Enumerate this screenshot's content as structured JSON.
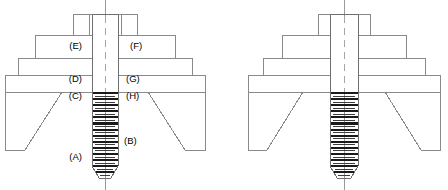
{
  "figure": {
    "background_color": "#ffffff",
    "line_color": "#8a8a8a",
    "thread_color": "#1a1a1a",
    "text_color": "#000000",
    "width": 448,
    "height": 190
  },
  "callouts": [
    {
      "id": "A",
      "label": "(A)",
      "x": 82,
      "y": 157,
      "anchor": "end",
      "description": "bolt thread lower region"
    },
    {
      "id": "B",
      "label": "(B)",
      "x": 124,
      "y": 141,
      "anchor": "start",
      "description": "bolt thread shank"
    },
    {
      "id": "C",
      "label": "(C)",
      "x": 82,
      "y": 96,
      "anchor": "end",
      "description": "left clamped member lower face"
    },
    {
      "id": "D",
      "label": "(D)",
      "x": 82,
      "y": 79,
      "anchor": "end",
      "description": "left base block"
    },
    {
      "id": "E",
      "label": "(E)",
      "x": 82,
      "y": 46,
      "anchor": "end",
      "description": "left upper washer step"
    },
    {
      "id": "F",
      "label": "(F)",
      "x": 130,
      "y": 46,
      "anchor": "start",
      "description": "right upper washer step"
    },
    {
      "id": "G",
      "label": "(G)",
      "x": 126,
      "y": 79,
      "anchor": "start",
      "description": "right base block"
    },
    {
      "id": "H",
      "label": "(H)",
      "x": 126,
      "y": 96,
      "anchor": "start",
      "description": "right clamped member lower face"
    }
  ],
  "diagrams": [
    {
      "name": "left-assembly",
      "cx": 105,
      "has_callouts": true,
      "nut": {
        "x": 73,
        "y": 14,
        "w": 64,
        "h": 21,
        "dividers": [
          89,
          121
        ]
      },
      "steps": [
        {
          "x": 35,
          "y": 35,
          "w": 140,
          "h": 23
        },
        {
          "x": 18,
          "y": 58,
          "w": 174,
          "h": 17
        },
        {
          "x": 5,
          "y": 75,
          "w": 200,
          "h": 17
        }
      ],
      "base": {
        "x": 5,
        "y": 92,
        "w": 200,
        "h": 58,
        "taper_top_left": 62,
        "taper_bot_left": 25,
        "taper_top_right": 148,
        "taper_bot_right": 185
      },
      "shank": {
        "x1": 92,
        "x2": 118,
        "top": 14,
        "bottom": 178,
        "thread_top": 93,
        "tip_start": 166,
        "tip_radius": 7,
        "thread_pitch": 6.1,
        "thread_inset": 3
      }
    },
    {
      "name": "right-assembly",
      "cx": 344,
      "has_callouts": false,
      "nut": {
        "x": 318,
        "y": 14,
        "w": 52,
        "h": 21,
        "dividers": [
          331,
          357
        ]
      },
      "steps": [
        {
          "x": 282,
          "y": 35,
          "w": 124,
          "h": 23
        },
        {
          "x": 263,
          "y": 58,
          "w": 162,
          "h": 17
        },
        {
          "x": 248,
          "y": 75,
          "w": 192,
          "h": 17
        }
      ],
      "base": {
        "x": 248,
        "y": 92,
        "w": 192,
        "h": 58,
        "taper_top_left": 303,
        "taper_bot_left": 267,
        "taper_top_right": 385,
        "taper_bot_right": 421
      },
      "shank": {
        "x1": 330,
        "x2": 358,
        "top": 14,
        "bottom": 178,
        "thread_top": 93,
        "tip_start": 166,
        "tip_radius": 7,
        "thread_pitch": 6.1,
        "thread_inset": 3
      }
    }
  ]
}
